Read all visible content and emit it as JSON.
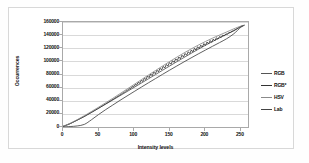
{
  "chart_data": {
    "type": "line",
    "title": "",
    "xlabel": "Intensity levels",
    "ylabel": "Occurrences",
    "xlim": [
      0,
      260
    ],
    "ylim": [
      0,
      160000
    ],
    "xticks": [
      0,
      50,
      100,
      150,
      200,
      250
    ],
    "yticks": [
      0,
      20000,
      40000,
      60000,
      80000,
      100000,
      120000,
      140000,
      160000
    ],
    "grid": true,
    "legend_position": "right",
    "x": [
      0,
      10,
      20,
      30,
      40,
      50,
      60,
      70,
      80,
      90,
      100,
      110,
      120,
      130,
      140,
      150,
      160,
      170,
      180,
      190,
      200,
      210,
      220,
      230,
      240,
      250,
      255
    ],
    "series": [
      {
        "name": "RGB",
        "color": "#555555",
        "values": [
          900,
          5200,
          10600,
          16200,
          22400,
          28600,
          34900,
          41200,
          47600,
          54000,
          60400,
          66900,
          73400,
          79900,
          86500,
          93000,
          99500,
          105900,
          112200,
          118400,
          124400,
          130200,
          135800,
          141200,
          146600,
          153000,
          155000
        ]
      },
      {
        "name": "RGB*",
        "color": "#333333",
        "values": [
          800,
          5000,
          10400,
          16000,
          22200,
          28600,
          35200,
          41900,
          48700,
          55600,
          62400,
          69200,
          76000,
          82700,
          89300,
          95900,
          102300,
          108500,
          114500,
          120200,
          125600,
          130900,
          136100,
          141400,
          147000,
          153200,
          155100
        ]
      },
      {
        "name": "HSV",
        "color": "#8a8a8a",
        "values": [
          1000,
          5600,
          11200,
          17200,
          23600,
          30200,
          36900,
          43700,
          50700,
          57800,
          64900,
          72000,
          79100,
          86100,
          93000,
          99800,
          106400,
          112800,
          118900,
          124700,
          130200,
          135300,
          140100,
          144800,
          149600,
          153800,
          155200
        ]
      },
      {
        "name": "Lab",
        "color": "#444444",
        "values": [
          300,
          700,
          1600,
          4000,
          11000,
          19000,
          26500,
          33500,
          40500,
          47300,
          54000,
          60700,
          67300,
          73800,
          80300,
          86700,
          93000,
          99200,
          105300,
          111300,
          117100,
          122900,
          128600,
          134500,
          142000,
          152000,
          155000
        ]
      }
    ],
    "legend": [
      {
        "label": "RGB",
        "color": "#555555"
      },
      {
        "label": "RGB*",
        "color": "#333333"
      },
      {
        "label": "HSV",
        "color": "#8a8a8a"
      },
      {
        "label": "Lab",
        "color": "#444444"
      }
    ],
    "ytick_labels": [
      "0",
      "20000",
      "40000",
      "60000",
      "80000",
      "100000",
      "120000",
      "140000",
      "160000"
    ],
    "xtick_labels": [
      "0",
      "50",
      "100",
      "150",
      "200",
      "250"
    ]
  }
}
